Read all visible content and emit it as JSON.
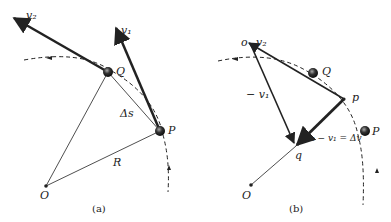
{
  "panel_a": {
    "caption": "(a)",
    "labels": {
      "v2": "v₂",
      "v1": "v₁",
      "Q": "Q",
      "P": "P",
      "delta_s": "Δs",
      "R": "R",
      "O": "O"
    }
  },
  "panel_b": {
    "caption": "(b)",
    "labels": {
      "o": "o",
      "v2": "v₂",
      "Q": "Q",
      "p": "p",
      "neg_v1": "− v₁",
      "delta_v": "v₂ − v₁ = Δv",
      "P": "P",
      "q": "q",
      "O": "O"
    }
  },
  "colors": {
    "ink": "#222222",
    "background": "#ffffff"
  }
}
